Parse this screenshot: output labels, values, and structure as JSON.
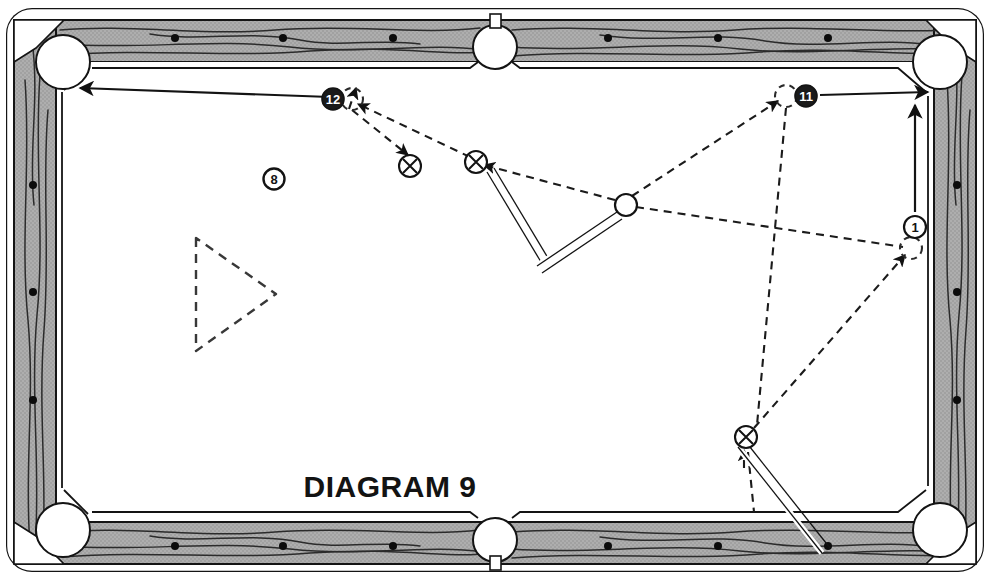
{
  "meta": {
    "title": "DIAGRAM 9",
    "width": 990,
    "height": 580
  },
  "caption": {
    "text": "DIAGRAM 9",
    "x": 390,
    "y": 497,
    "font_size": 30
  },
  "colors": {
    "ink": "#1a1a1a",
    "rail_fill": "#a8a8a8",
    "rail_grain": "#2b2b2b",
    "cloth": "#ffffff",
    "pocket_fill": "#ffffff",
    "ball_dark": "#1a1a1a",
    "ball_light": "#ffffff",
    "ghost_dash": "#303030"
  },
  "table": {
    "outer": {
      "x": 6,
      "y": 8,
      "w": 978,
      "h": 564,
      "corner_radius": 26
    },
    "rail_thickness": 42,
    "playfield": {
      "x": 60,
      "y": 62,
      "w": 870,
      "h": 456
    },
    "sight_dots_top": [
      {
        "x": 175,
        "y": 38
      },
      {
        "x": 283,
        "y": 38
      },
      {
        "x": 393,
        "y": 38
      },
      {
        "x": 608,
        "y": 38
      },
      {
        "x": 718,
        "y": 38
      },
      {
        "x": 828,
        "y": 38
      }
    ],
    "sight_dots_bottom": [
      {
        "x": 175,
        "y": 546
      },
      {
        "x": 283,
        "y": 546
      },
      {
        "x": 393,
        "y": 546
      },
      {
        "x": 608,
        "y": 546
      },
      {
        "x": 718,
        "y": 546
      },
      {
        "x": 828,
        "y": 546
      }
    ],
    "sight_dots_left": [
      {
        "x": 33,
        "y": 185
      },
      {
        "x": 33,
        "y": 292
      },
      {
        "x": 33,
        "y": 400
      }
    ],
    "sight_dots_right": [
      {
        "x": 957,
        "y": 185
      },
      {
        "x": 957,
        "y": 292
      },
      {
        "x": 957,
        "y": 400
      }
    ]
  },
  "pockets": [
    {
      "name": "top-left",
      "cx": 63,
      "cy": 62,
      "r": 27,
      "type": "corner"
    },
    {
      "name": "top-side",
      "cx": 495,
      "cy": 47,
      "r": 22,
      "type": "side"
    },
    {
      "name": "top-right",
      "cx": 940,
      "cy": 62,
      "r": 27,
      "type": "corner"
    },
    {
      "name": "bottom-left",
      "cx": 63,
      "cy": 530,
      "r": 27,
      "type": "corner"
    },
    {
      "name": "bottom-side",
      "cx": 495,
      "cy": 540,
      "r": 22,
      "type": "side"
    },
    {
      "name": "bottom-right",
      "cx": 940,
      "cy": 530,
      "r": 27,
      "type": "corner"
    }
  ],
  "rack_triangle": {
    "points": "196,238 196,351 276,294",
    "style": "dashed"
  },
  "balls": [
    {
      "id": "ball-12",
      "label": "12",
      "cx": 333,
      "cy": 99,
      "r": 11,
      "fill": "dark",
      "text": "light"
    },
    {
      "id": "ball-8",
      "label": "8",
      "cx": 274,
      "cy": 179,
      "r": 10,
      "fill": "light",
      "text": "dark"
    },
    {
      "id": "ball-11",
      "label": "11",
      "cx": 806,
      "cy": 96,
      "r": 11,
      "fill": "dark",
      "text": "light"
    },
    {
      "id": "ball-1",
      "label": "1",
      "cx": 915,
      "cy": 227,
      "r": 11,
      "fill": "light",
      "text": "dark"
    }
  ],
  "object_balls_x": [
    {
      "id": "x-ball-upper-left",
      "cx": 410,
      "cy": 166,
      "r": 11
    },
    {
      "id": "x-ball-upper-right",
      "cx": 476,
      "cy": 162,
      "r": 11
    },
    {
      "id": "x-ball-lower",
      "cx": 746,
      "cy": 437,
      "r": 11
    }
  ],
  "cue_balls": [
    {
      "id": "cue-ball-center",
      "cx": 626,
      "cy": 205,
      "r": 11
    }
  ],
  "ghost_balls": [
    {
      "id": "ghost-at-12",
      "cx": 352,
      "cy": 99,
      "r": 11
    },
    {
      "id": "ghost-at-11",
      "cx": 786,
      "cy": 96,
      "r": 11
    },
    {
      "id": "ghost-at-1",
      "cx": 911,
      "cy": 248,
      "r": 11
    }
  ],
  "cue_sticks": [
    {
      "id": "cue-stick-upper",
      "x1": 541,
      "y1": 262,
      "x2": 487,
      "y2": 172,
      "width": 5
    },
    {
      "id": "cue-stick-middle",
      "x1": 537,
      "y1": 266,
      "x2": 617,
      "y2": 212,
      "width": 5
    },
    {
      "id": "cue-stick-lower",
      "x1": 822,
      "y1": 553,
      "x2": 738,
      "y2": 447,
      "width": 5
    }
  ],
  "solid_arrows": [
    {
      "id": "arrow-12-to-corner",
      "from": {
        "x": 330,
        "y": 97
      },
      "to": {
        "x": 80,
        "y": 88
      }
    },
    {
      "id": "arrow-11-to-corner",
      "from": {
        "x": 820,
        "y": 95
      },
      "to": {
        "x": 928,
        "y": 92
      }
    },
    {
      "id": "arrow-1-upward",
      "from": {
        "x": 915,
        "y": 212
      },
      "to": {
        "x": 915,
        "y": 105
      }
    }
  ],
  "dashed_paths": [
    {
      "id": "path-cue-to-x-upper",
      "d": "M 615 200 L 484 165",
      "arrow": "end"
    },
    {
      "id": "path-x-to-ghost12",
      "d": "M 470 157 L 358 104",
      "arrow": "end"
    },
    {
      "id": "path-ghost12-deflect",
      "d": "M 352 110 L 408 155",
      "arrow": "end"
    },
    {
      "id": "path-ghost12-up",
      "d": "M 349 109 L 356 88",
      "arrow": "end"
    },
    {
      "id": "path-cue-to-ghost11",
      "d": "M 632 196 L 778 101",
      "arrow": "end"
    },
    {
      "id": "path-cue-to-ghost1",
      "d": "M 636 207 L 903 247",
      "arrow": "none"
    },
    {
      "id": "path-ghost11-down",
      "d": "M 786 108 L 757 425",
      "arrow": "none"
    },
    {
      "id": "path-x-lower-to-1",
      "d": "M 754 428 L 905 255",
      "arrow": "end"
    },
    {
      "id": "path-x-lower-down",
      "d": "M 746 450 L 752 512",
      "arrow": "none"
    },
    {
      "id": "path-x-lower-up-tick",
      "d": "M 744 462 L 744 449",
      "arrow": "end"
    }
  ]
}
